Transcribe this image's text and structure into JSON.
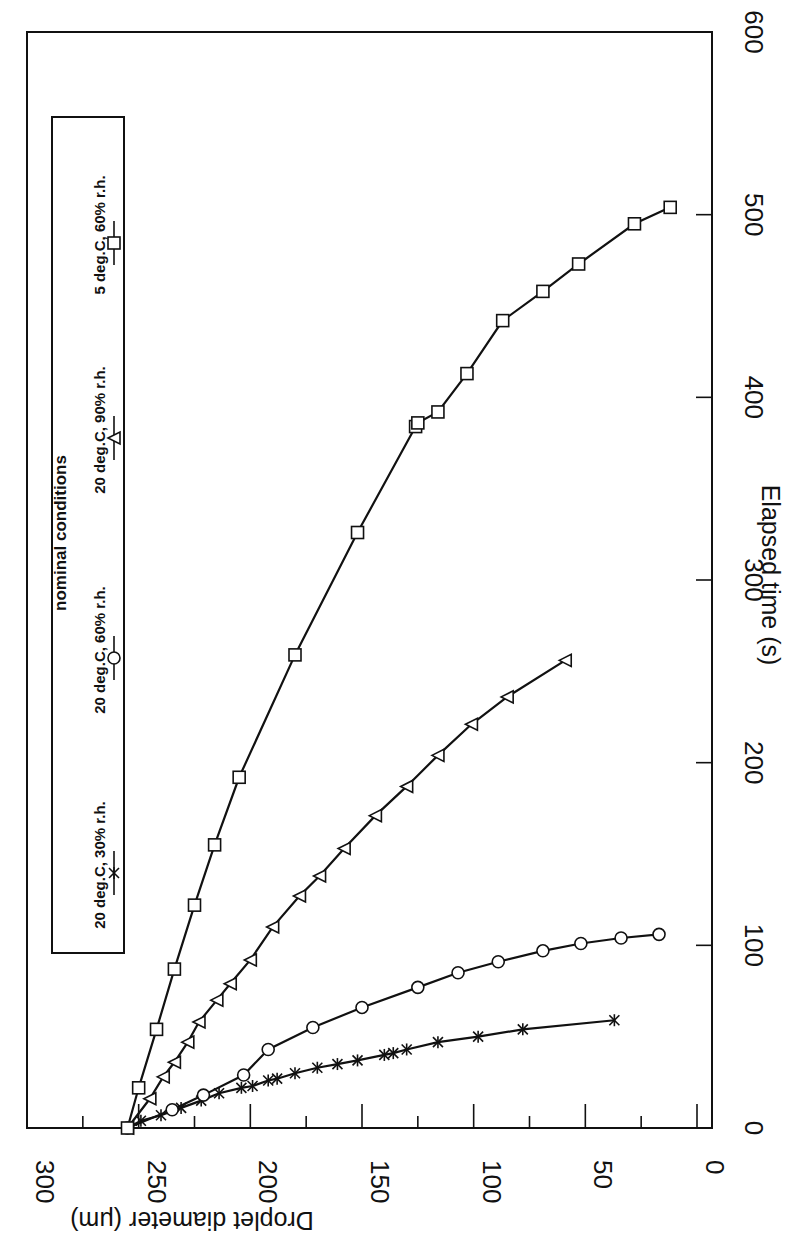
{
  "chart_data": {
    "type": "line",
    "title": "",
    "xlabel": "Elapsed time (s)",
    "ylabel": "Droplet diameter (μm)",
    "xlim": [
      0,
      600
    ],
    "ylim": [
      0,
      300
    ],
    "x_ticks": [
      "0",
      "100",
      "200",
      "300",
      "400",
      "500",
      "600"
    ],
    "y_ticks": [
      "0",
      "50",
      "100",
      "150",
      "200",
      "250",
      "300"
    ],
    "grid": false,
    "orientation_note": "Figure is rendered rotated 90° clockwise: time axis runs vertically along the right side, diameter axis runs horizontally along the bottom (reversed).",
    "legend": {
      "title": "nominal conditions",
      "position": "upper-left (rotated)",
      "entries": [
        {
          "label": "20 deg.C, 30% r.h.",
          "marker": "asterisk"
        },
        {
          "label": "20 deg.C, 60% r.h.",
          "marker": "circle"
        },
        {
          "label": "20 deg.C, 90% r.h.",
          "marker": "triangle"
        },
        {
          "label": "5 deg.C, 60% r.h.",
          "marker": "square"
        }
      ]
    },
    "series": [
      {
        "name": "20 deg.C, 30% r.h.",
        "marker": "asterisk",
        "x": [
          0,
          4,
          7,
          11,
          15,
          19,
          22,
          23,
          26,
          27,
          30,
          33,
          35,
          37,
          40,
          41,
          43,
          47,
          50,
          54,
          59
        ],
        "y": [
          255,
          249,
          240,
          231,
          222,
          214,
          204,
          199,
          192,
          188,
          180,
          170,
          161,
          152,
          140,
          136,
          130,
          116,
          98,
          78,
          37
        ]
      },
      {
        "name": "20 deg.C, 60% r.h.",
        "marker": "circle",
        "x": [
          0,
          10,
          18,
          29,
          43,
          55,
          66,
          77,
          85,
          91,
          97,
          101,
          104,
          106
        ],
        "y": [
          255,
          235,
          221,
          203,
          192,
          172,
          150,
          125,
          107,
          89,
          69,
          52,
          34,
          17
        ]
      },
      {
        "name": "20 deg.C, 90% r.h.",
        "marker": "triangle",
        "x": [
          0,
          16,
          28,
          36,
          47,
          58,
          70,
          79,
          92,
          110,
          127,
          138,
          153,
          171,
          187,
          204,
          221,
          236,
          256
        ],
        "y": [
          255,
          245,
          239,
          234,
          228,
          223,
          215,
          209,
          200,
          190,
          178,
          169,
          158,
          144,
          130,
          116,
          101,
          85,
          59
        ]
      },
      {
        "name": "5 deg.C, 60% r.h.",
        "marker": "square",
        "x": [
          0,
          22,
          54,
          87,
          122,
          155,
          192,
          259,
          326,
          384,
          386,
          392,
          413,
          442,
          458,
          473,
          495,
          504
        ],
        "y": [
          255,
          250,
          242,
          234,
          225,
          216,
          205,
          180,
          152,
          126,
          125,
          116,
          103,
          87,
          69,
          53,
          28,
          12
        ]
      }
    ]
  }
}
